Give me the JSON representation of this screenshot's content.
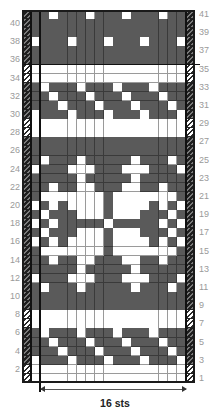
{
  "chart_data": {
    "type": "table",
    "title": "",
    "rows": 41,
    "repeat_stitches": 16,
    "width_label": "16 sts",
    "row_labels_left": [
      "40",
      "38",
      "36",
      "34",
      "32",
      "30",
      "28",
      "26",
      "24",
      "22",
      "20",
      "18",
      "16",
      "14",
      "12",
      "10",
      "8",
      "6",
      "4",
      "2"
    ],
    "row_labels_right": [
      "41",
      "39",
      "37",
      "35",
      "33",
      "31",
      "29",
      "27",
      "25",
      "23",
      "21",
      "19",
      "17",
      "15",
      "13",
      "11",
      "9",
      "7",
      "5",
      "3",
      "1"
    ],
    "legend": {
      "dark": "contrast color",
      "light": "main color (white)",
      "hatched": "edge stitch"
    },
    "colors": {
      "dark": "#5a5a5a",
      "light": "#ffffff",
      "label": "#9a9a9a"
    },
    "columns_note": "Each row lists the 0-based indices (0 = edge stitch left of the repeat line, 1-16 = repeat) of LIGHT cells; 'all' means every cell is light; [] means all dark",
    "light_cells": {
      "41": [
        2,
        6,
        10,
        14
      ],
      "40": [],
      "39": [],
      "38": [
        0,
        4,
        8,
        12,
        16
      ],
      "37": [],
      "36": [],
      "35": "all",
      "34": "all",
      "33": [
        1,
        5,
        9,
        13
      ],
      "32": [
        2,
        6,
        10,
        14
      ],
      "31": [
        3,
        7,
        11,
        15
      ],
      "30": [
        0,
        4,
        8,
        12,
        16
      ],
      "29": "all",
      "28": "all",
      "27": [],
      "26": [],
      "25": [
        1,
        5,
        11,
        15
      ],
      "24": [
        0,
        4,
        5,
        6,
        10,
        11,
        12,
        16
      ],
      "23": [
        5,
        11
      ],
      "22": [
        2,
        5,
        6,
        10,
        11,
        14
      ],
      "21": [
        1,
        2,
        3,
        4,
        5,
        6,
        7,
        9,
        10,
        11,
        12,
        13,
        14,
        15
      ],
      "20": [
        0,
        2,
        4,
        5,
        6,
        7,
        9,
        10,
        11,
        12,
        14,
        16
      ],
      "19": [
        1,
        5,
        6,
        7,
        9,
        10,
        11,
        15
      ],
      "18": [
        0,
        2,
        8,
        14,
        16
      ],
      "17": [
        1,
        5,
        6,
        7,
        9,
        10,
        11,
        15
      ],
      "16": [
        0,
        2,
        4,
        5,
        6,
        7,
        9,
        10,
        11,
        12,
        14,
        16
      ],
      "15": [
        1,
        2,
        3,
        4,
        5,
        6,
        7,
        9,
        10,
        11,
        12,
        13,
        14,
        15
      ],
      "14": [
        2,
        5,
        6,
        10,
        11,
        14
      ],
      "13": [
        5,
        11
      ],
      "12": [
        0,
        4,
        5,
        6,
        10,
        11,
        12,
        16
      ],
      "11": [
        1,
        5,
        11,
        15
      ],
      "10": [],
      "9": [],
      "8": "all",
      "7": "all",
      "6": [
        1,
        5,
        9,
        13
      ],
      "5": [
        2,
        6,
        10,
        14
      ],
      "4": [
        3,
        7,
        11,
        15
      ],
      "3": [
        0,
        4,
        8,
        12,
        16
      ],
      "2": "all",
      "1": "all"
    },
    "section_divider_after_row": 36
  },
  "footer": {
    "width_label": "16 sts"
  }
}
